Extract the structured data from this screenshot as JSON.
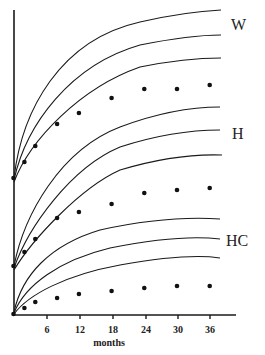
{
  "chart_data": {
    "type": "line",
    "title": "",
    "xlabel": "months",
    "ylabel": "",
    "x_ticks": [
      6,
      12,
      18,
      24,
      30,
      36
    ],
    "xlim": [
      0,
      40
    ],
    "grid": false,
    "legend": "inline labels at right of curve groups",
    "groups": [
      {
        "label": "W",
        "reference_curves": 3,
        "points": {
          "x": [
            0,
            2,
            4,
            8,
            12,
            18,
            24,
            30,
            36
          ],
          "y_px": [
            178,
            162,
            146,
            124,
            113,
            98,
            89,
            89,
            85
          ]
        }
      },
      {
        "label": "H",
        "reference_curves": 3,
        "points": {
          "x": [
            0,
            2,
            4,
            8,
            12,
            18,
            24,
            30,
            36
          ],
          "y_px": [
            266,
            252,
            239,
            218,
            212,
            204,
            193,
            190,
            188
          ]
        }
      },
      {
        "label": "HC",
        "reference_curves": 3,
        "points": {
          "x": [
            0,
            2,
            4,
            8,
            12,
            18,
            24,
            30,
            36
          ],
          "y_px": [
            314,
            308,
            302,
            298,
            294,
            291,
            288,
            286,
            286
          ]
        }
      }
    ]
  },
  "axis": {
    "xlabel": "months",
    "ticks": [
      "6",
      "12",
      "18",
      "24",
      "30",
      "36"
    ]
  },
  "labels": {
    "w": "W",
    "h": "H",
    "hc": "HC"
  }
}
